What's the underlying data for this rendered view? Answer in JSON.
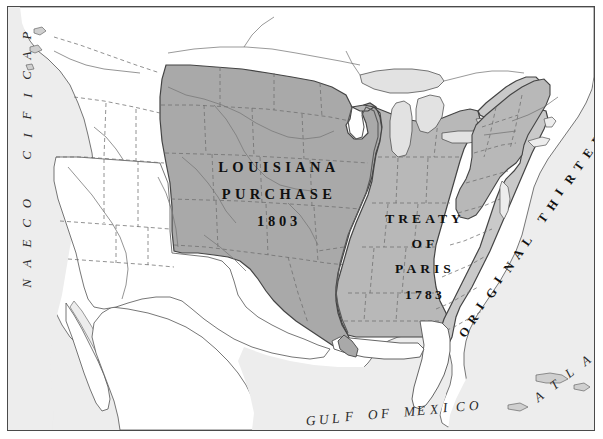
{
  "figure": {
    "kind": "historical-reference-map",
    "frame_stroke": "#4a4a4a",
    "background": "#fbfbfb"
  },
  "palette": {
    "louisiana_purchase_fill": "#a9a9a9",
    "treaty_of_paris_fill": "#b8b8b8",
    "original_thirteen_fill": "#c9c9c9",
    "unclaimed_fill": "#ffffff",
    "ocean_fill": "#ededed",
    "lake_fill": "#e2e2e2",
    "coast_stroke": "#545454",
    "state_boundary_stroke": "#6e6e6e",
    "river_stroke": "#7a7a7a",
    "label_color": "#141414"
  },
  "territories": [
    {
      "id": "louisiana-purchase",
      "name": "Louisiana Purchase",
      "lines": [
        "LOUISIANA",
        "PURCHASE"
      ],
      "year": "1803",
      "fill": "#a9a9a9"
    },
    {
      "id": "treaty-of-paris",
      "name": "Treaty of Paris",
      "lines": [
        "TREATY",
        "OF",
        "PARIS"
      ],
      "year": "1783",
      "fill": "#b8b8b8"
    },
    {
      "id": "original-thirteen-states",
      "name": "Original Thirteen States",
      "text": "ORIGINAL THIRTEEN STATES",
      "fill": "#c9c9c9",
      "orientation": "diagonal-ascending"
    }
  ],
  "water_labels": [
    {
      "id": "pacific-ocean",
      "words": [
        "PACIFIC",
        "OCEAN"
      ],
      "orientation": "vertical",
      "style": "italic"
    },
    {
      "id": "atlantic-ocean",
      "words": [
        "OCEAN",
        "ATLANTIC"
      ],
      "text": "ATLANTIC OCEAN",
      "orientation": "diagonal-ascending",
      "style": "italic"
    },
    {
      "id": "gulf-of-mexico",
      "text": "GULF OF MEXICO",
      "orientation": "horizontal-curved",
      "style": "italic"
    }
  ],
  "labels": {
    "louisiana_line_1": "LOUISIANA",
    "louisiana_line_2": "PURCHASE",
    "louisiana_year": "1803",
    "treaty_line_1": "TREATY",
    "treaty_line_2": "OF",
    "treaty_line_3": "PARIS",
    "treaty_year": "1783",
    "original_thirteen": "ORIGINAL THIRTEEN STATES",
    "pacific": "PACIFIC",
    "pacific_ocean": "OCEAN",
    "atlantic": "ATLANTIC",
    "atlantic_ocean": "OCEAN",
    "gulf": "GULF OF MEXICO"
  }
}
